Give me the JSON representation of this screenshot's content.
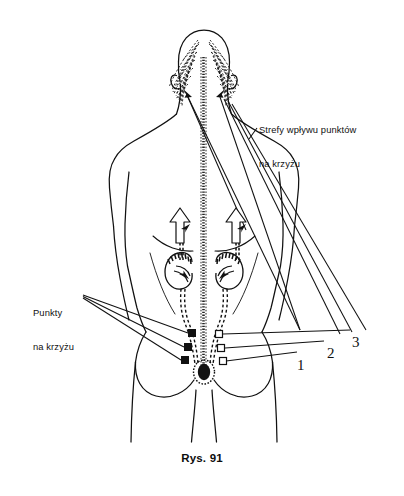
{
  "figure": {
    "caption": "Rys. 91",
    "background_color": "#ffffff",
    "ink_color": "#111111",
    "width": 404,
    "height": 496
  },
  "labels": {
    "zones": {
      "line1": "Strefy wpływu punktów",
      "line2": "na krzyżu"
    },
    "points": {
      "line1": "Punkty",
      "line2": "na krzyżu"
    },
    "numbers": {
      "one": "1",
      "two": "2",
      "three": "3"
    }
  },
  "markers": {
    "left_sacral_points": [
      {
        "id": "left-point-1",
        "shape": "filled-square",
        "x": 192,
        "y": 333
      },
      {
        "id": "left-point-2",
        "shape": "filled-square",
        "x": 188,
        "y": 347
      },
      {
        "id": "left-point-3",
        "shape": "filled-square",
        "x": 185,
        "y": 360
      }
    ],
    "right_sacral_points": [
      {
        "id": "right-point-1",
        "shape": "hollow-square",
        "x": 219,
        "y": 334
      },
      {
        "id": "right-point-2",
        "shape": "hollow-square",
        "x": 221,
        "y": 348
      },
      {
        "id": "right-point-3",
        "shape": "hollow-square",
        "x": 223,
        "y": 361
      }
    ],
    "shoulder_arrows": [
      {
        "id": "left-shoulder-arrow",
        "direction": "up"
      },
      {
        "id": "right-shoulder-arrow",
        "direction": "up"
      }
    ],
    "head_arrows": [
      {
        "id": "left-head-arrow",
        "direction": "up-left"
      },
      {
        "id": "right-head-arrow",
        "direction": "up-right"
      }
    ]
  }
}
